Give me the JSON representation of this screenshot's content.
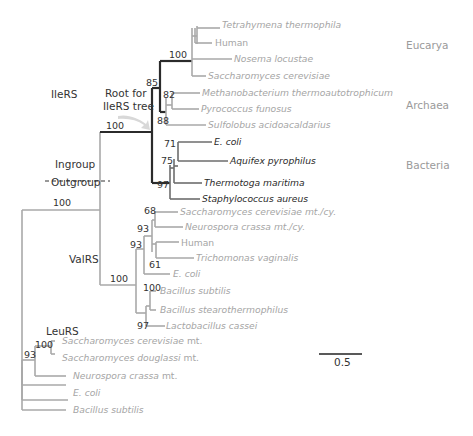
{
  "figure": {
    "type": "phylogenetic-tree",
    "annotations": {
      "ileRS": "IleRS",
      "root_line1": "Root for",
      "root_line2": "IleRS tree",
      "ingroup": "Ingroup",
      "outgroup": "Outgroup",
      "valRS": "ValRS",
      "leuRS": "LeuRS"
    },
    "domains": {
      "eucarya": "Eucarya",
      "archaea": "Archaea",
      "bacteria": "Bacteria"
    },
    "support": {
      "root_ileRS_valRS": "100",
      "ileRS_stem": "100",
      "ileRS_euc_arch": "85",
      "eucarya": "100",
      "archaea_meth_pyro": "82",
      "archaea": "88",
      "bact_ecoli_aquifex": "71",
      "bact_plus_thermotoga": "75",
      "bacteria": "97",
      "valRS_stem": "100",
      "valRS_euk": "93",
      "valRS_euk_plus_ecoli": "93",
      "valRS_sc_nc": "68",
      "valRS_human_tv": "61",
      "valRS_bacillus": "100",
      "valRS_gram_pos": "97",
      "leuRS_sacch": "100",
      "leuRS_fungi": "93"
    },
    "taxa": {
      "ile": [
        {
          "name": "Tetrahymena thermophila"
        },
        {
          "name": "Human"
        },
        {
          "name": "Nosema locustae"
        },
        {
          "name": "Saccharomyces cerevisiae"
        },
        {
          "name": "Methanobacterium thermoautotrophicum"
        },
        {
          "name": "Pyrococcus funosus"
        },
        {
          "name": "Sulfolobus acidoacaldarius"
        },
        {
          "name": "E. coli"
        },
        {
          "name": "Aquifex pyrophilus"
        },
        {
          "name": "Thermotoga maritima"
        },
        {
          "name": "Staphylococcus aureus"
        }
      ],
      "val": [
        {
          "name": "Saccharomyces cerevisiae mt./cy."
        },
        {
          "name": "Neurospora crassa mt./cy."
        },
        {
          "name": "Human"
        },
        {
          "name": "Trichomonas vaginalis"
        },
        {
          "name": "E. coli"
        },
        {
          "name": "Bacillus subtilis"
        },
        {
          "name": "Bacillus stearothermophilus"
        },
        {
          "name": "Lactobacillus cassei"
        }
      ],
      "leu": [
        {
          "name": "Saccharomyces cerevisiae",
          "suffix": " mt."
        },
        {
          "name": "Saccharomyces douglassi",
          "suffix": " mt."
        },
        {
          "name": "Neurospora crassa",
          "suffix": " mt."
        },
        {
          "name": "E. coli"
        },
        {
          "name": "Bacillus subtilis"
        }
      ]
    },
    "scale_bar": {
      "label": "0.5"
    }
  }
}
